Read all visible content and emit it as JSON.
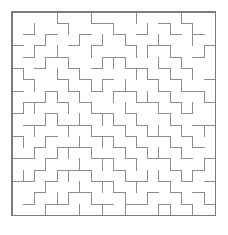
{
  "page": {
    "background_color": "#ffffff",
    "width": 228,
    "height": 235
  },
  "maze": {
    "name": "square-maze",
    "type": "perfect-maze-grid",
    "cols": 18,
    "rows": 18,
    "cell_size": 11.3,
    "origin_x": 12,
    "origin_y": 12,
    "wall_color": "#8c8c8c",
    "border_color": "#7a7a7a",
    "wall_width": 1,
    "border_width": 1.2,
    "entrance": "none-visible",
    "exit": "none-visible",
    "border_closed": true,
    "horizontal_walls": [
      "111111111111111111",
      "000010011000010100",
      "010100100101001010",
      "101001010010110001",
      "010110001100001010",
      "101001010011010100",
      "010010101000101001",
      "100101010110010110",
      "011010100001101001",
      "100100011010010100",
      "011011100101001011",
      "100100011010110100",
      "001011100101001010",
      "110100011010110101",
      "001011100100001010",
      "110100011011010101",
      "001001100100101010",
      "010110011011010101",
      "111111111111111111"
    ],
    "vertical_walls": [
      "1000100100010001001",
      "1010010001001010101",
      "1001001010100100101",
      "1010100100011010011",
      "1001010011100101001",
      "1100101000011010101",
      "1010010110100101001",
      "1001101001011010011",
      "1110010100100101101",
      "1001101011010010001",
      "1010010100101101011",
      "1101001011010010101",
      "1010110100101101001",
      "1001001011010010011",
      "1110110100101101101",
      "1001001011010010001",
      "1010110100101001011",
      "1001001010100110101"
    ]
  }
}
